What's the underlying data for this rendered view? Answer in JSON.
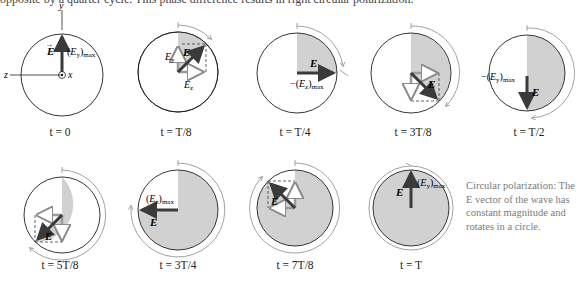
{
  "intro_text": "opposite by a quarter cycle. This phase difference results in right circular polarization.",
  "colors": {
    "circle_stroke": "#231f20",
    "shade": "#d1d1d1",
    "vector": "#3a3a3a",
    "component": "#9a9a9a",
    "rotation_arrow": "#8a8a8a",
    "caption": "#7a7a7a"
  },
  "axes": {
    "y_label": "y",
    "z_label": "z",
    "x_label": "x"
  },
  "vector_label": "E",
  "panels": [
    {
      "id": "t0",
      "time_label": "t = 0",
      "annotation": "(Ey)max",
      "angle_deg": 90
    },
    {
      "id": "t1",
      "time_label": "t = T/8",
      "annotation": "",
      "component_labels": [
        "Ey",
        "Ez"
      ],
      "angle_deg": 45
    },
    {
      "id": "t2",
      "time_label": "t = T/4",
      "annotation": "−(Ez)max",
      "angle_deg": 0
    },
    {
      "id": "t3",
      "time_label": "t = 3T/8",
      "annotation": "",
      "angle_deg": -45
    },
    {
      "id": "t4",
      "time_label": "t = T/2",
      "annotation": "−(Ey)max",
      "angle_deg": -90
    },
    {
      "id": "t5",
      "time_label": "t = 5T/8",
      "annotation": "",
      "angle_deg": -135
    },
    {
      "id": "t6",
      "time_label": "t = 3T/4",
      "annotation": "(Ez)max",
      "angle_deg": 180
    },
    {
      "id": "t7",
      "time_label": "t = 7T/8",
      "annotation": "",
      "angle_deg": 135
    },
    {
      "id": "t8",
      "time_label": "t = T",
      "annotation": "(Ey)max",
      "angle_deg": 90
    }
  ],
  "caption": "Circular polarization: The E vector of the wave has constant magnitude and rotates in a circle."
}
